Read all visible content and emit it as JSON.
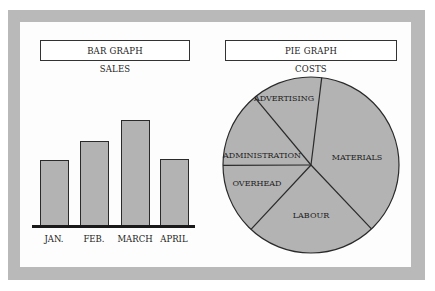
{
  "chart_data": [
    {
      "type": "bar",
      "title": "BAR GRAPH",
      "subtitle": "SALES",
      "categories": [
        "JAN.",
        "FEB.",
        "MARCH",
        "APRIL"
      ],
      "values": [
        65,
        84,
        105,
        66
      ],
      "xlabel": "",
      "ylabel": "",
      "grid": false,
      "legend": "none",
      "bar_color": "#b3b3b3"
    },
    {
      "type": "pie",
      "title": "PIE GRAPH",
      "subtitle": "COSTS",
      "categories": [
        "MATERIALS",
        "LABOUR",
        "OVERHEAD",
        "ADMINISTRATION",
        "ADVERTISING"
      ],
      "values": [
        36,
        24,
        13,
        14,
        13
      ],
      "start_angle_deg": 7,
      "direction": "clockwise",
      "legend": "labels-on-slices",
      "slice_color": "#b3b3b3"
    }
  ],
  "colors": {
    "frame": "#b9b9b9",
    "background": "#fdfdfd",
    "fill": "#b3b3b3",
    "stroke": "#2a2a2a",
    "axis": "#1a1a1a"
  }
}
